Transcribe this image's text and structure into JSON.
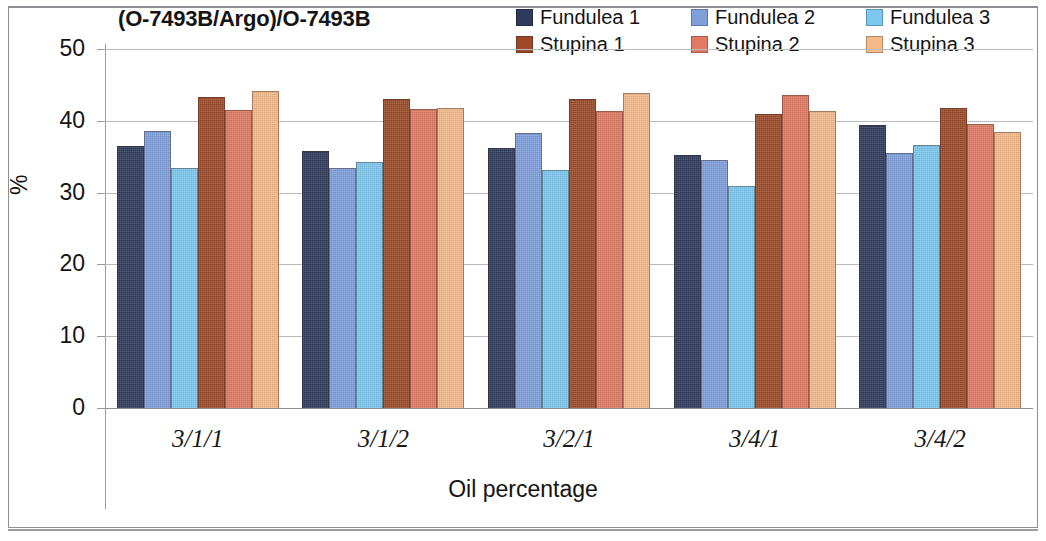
{
  "chart_data": {
    "type": "bar",
    "title": "(O-7493B/Argo)/O-7493B",
    "xlabel": "Oil percentage",
    "ylabel": "%",
    "ylim": [
      0,
      50
    ],
    "yticks": [
      "0",
      "10",
      "20",
      "30",
      "40",
      "50"
    ],
    "grid": true,
    "legend_position": "top-right",
    "categories": [
      "3/1/1",
      "3/1/2",
      "3/2/1",
      "3/4/1",
      "3/4/2"
    ],
    "series": [
      {
        "name": "Fundulea 1",
        "color": "#2e3a5c",
        "values": [
          36.5,
          35.8,
          36.2,
          35.2,
          39.4
        ]
      },
      {
        "name": "Fundulea 2",
        "color": "#7f9fdb",
        "values": [
          38.6,
          33.4,
          38.3,
          34.6,
          35.5
        ]
      },
      {
        "name": "Fundulea 3",
        "color": "#7cc8f0",
        "values": [
          33.4,
          34.2,
          33.1,
          30.9,
          36.6
        ]
      },
      {
        "name": "Stupina 1",
        "color": "#9c4a28",
        "values": [
          43.3,
          43.1,
          43.0,
          41.0,
          41.8
        ]
      },
      {
        "name": "Stupina 2",
        "color": "#e07a63",
        "values": [
          41.5,
          41.6,
          41.3,
          43.6,
          39.5
        ]
      },
      {
        "name": "Stupina 3",
        "color": "#f5b98a",
        "values": [
          44.1,
          41.8,
          43.9,
          41.3,
          38.4
        ]
      }
    ]
  }
}
